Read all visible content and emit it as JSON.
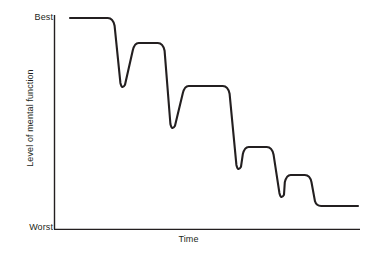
{
  "chart_data": {
    "type": "line",
    "title": "",
    "xlabel": "Time",
    "ylabel": "Level of mental function",
    "ytick_labels": [
      "Best",
      "Worst"
    ],
    "xtick_labels": [],
    "grid": false,
    "legend": null,
    "axis_color": "#231f20",
    "line_color": "#231f20",
    "line_width": 2.1,
    "background": "#ffffff",
    "plot_area": {
      "x_left": 54,
      "x_right": 360,
      "y_top": 15,
      "y_bottom": 229
    },
    "y_axis_semantics": {
      "top_is": "Best",
      "bottom_is": "Worst",
      "numeric_top": 100,
      "numeric_bottom": 0
    },
    "plateaus": [
      {
        "index": 1,
        "x_start": 70,
        "x_end": 113,
        "y_px": 18,
        "level": 100
      },
      {
        "index": 2,
        "x_start": 135,
        "x_end": 163,
        "y_px": 43,
        "level": 88
      },
      {
        "index": 3,
        "x_start": 185,
        "x_end": 228,
        "y_px": 86,
        "level": 67
      },
      {
        "index": 4,
        "x_start": 245,
        "x_end": 272,
        "y_px": 147,
        "level": 38
      },
      {
        "index": 5,
        "x_start": 287,
        "x_end": 310,
        "y_px": 175,
        "level": 25
      },
      {
        "index": 6,
        "x_start": 317,
        "x_end": 358,
        "y_px": 206,
        "level": 11
      }
    ],
    "troughs": [
      {
        "index": 1,
        "x_px": 122,
        "y_px": 90,
        "level": 65
      },
      {
        "index": 2,
        "x_px": 172,
        "y_px": 131,
        "level": 46
      },
      {
        "index": 3,
        "x_px": 238,
        "y_px": 172,
        "level": 27
      },
      {
        "index": 4,
        "x_px": 281,
        "y_px": 200,
        "level": 14
      }
    ],
    "series": [
      {
        "name": "Level of mental function over time",
        "points_px": [
          [
            70,
            18
          ],
          [
            113,
            18
          ],
          [
            118,
            40
          ],
          [
            122,
            90
          ],
          [
            126,
            60
          ],
          [
            131,
            43
          ],
          [
            135,
            43
          ],
          [
            163,
            43
          ],
          [
            168,
            80
          ],
          [
            172,
            131
          ],
          [
            177,
            105
          ],
          [
            182,
            86
          ],
          [
            185,
            86
          ],
          [
            228,
            86
          ],
          [
            233,
            130
          ],
          [
            238,
            172
          ],
          [
            241,
            158
          ],
          [
            245,
            147
          ],
          [
            248,
            147
          ],
          [
            272,
            147
          ],
          [
            277,
            175
          ],
          [
            281,
            200
          ],
          [
            284,
            186
          ],
          [
            287,
            175
          ],
          [
            290,
            175
          ],
          [
            310,
            175
          ],
          [
            313,
            192
          ],
          [
            317,
            206
          ],
          [
            358,
            206
          ]
        ],
        "values": [
          100,
          100,
          65,
          88,
          88,
          46,
          67,
          67,
          27,
          38,
          38,
          14,
          25,
          25,
          11,
          11
        ]
      }
    ]
  },
  "axes": {
    "y_best_label": "Best",
    "y_worst_label": "Worst",
    "y_title": "Level of mental function",
    "x_title": "Time"
  }
}
